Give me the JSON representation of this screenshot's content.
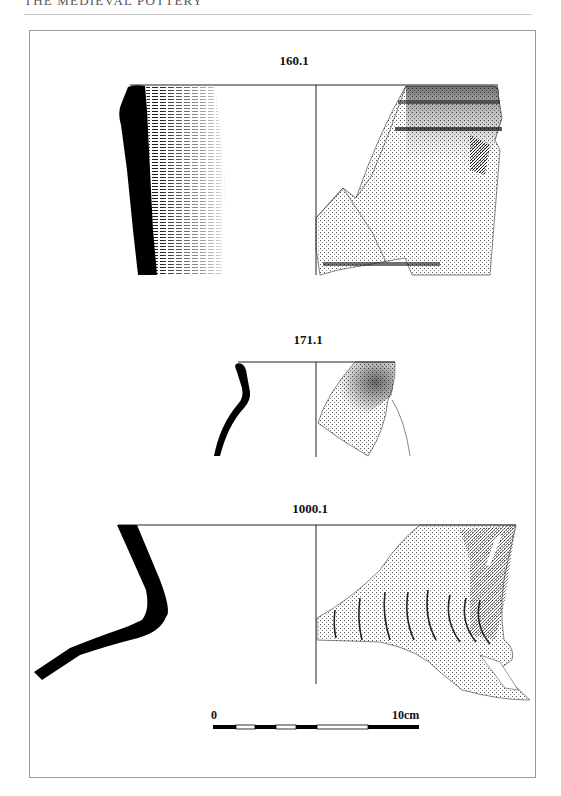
{
  "page": {
    "running_head": "THE MEDIEVAL POTTERY"
  },
  "figures": [
    {
      "id": "fig-160-1",
      "label": "160.1"
    },
    {
      "id": "fig-171-1",
      "label": "171.1"
    },
    {
      "id": "fig-1000-1",
      "label": "1000.1"
    }
  ],
  "scale_bar": {
    "start_label": "0",
    "end_label": "10cm",
    "segments": [
      "black",
      "white",
      "black",
      "white",
      "black",
      "white",
      "black"
    ]
  },
  "colors": {
    "ink": "#000000",
    "frame": "#9a9a9a",
    "rule": "#c8c8c8"
  }
}
